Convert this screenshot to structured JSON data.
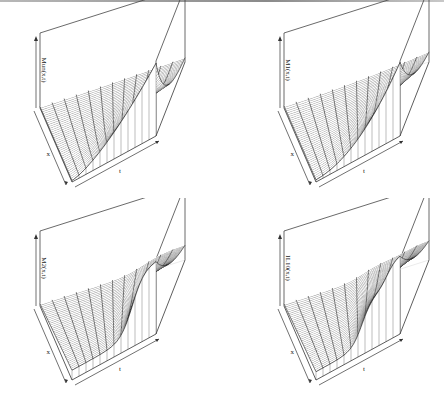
{
  "figure": {
    "layout": "2x2 grid of 3D perspective surface plots"
  },
  "chart_data": [
    {
      "type": "surface",
      "title": "",
      "xlabel": "x",
      "ylabel": "t",
      "zlabel": "Mun(x,t)",
      "shape": "increasing in t, steep rise near x = 0, decaying along x",
      "grid": {
        "x_lines": 40,
        "t_lines": 12
      },
      "description": "Monotone increase over time, concentrated at small x"
    },
    {
      "type": "surface",
      "title": "",
      "xlabel": "x",
      "ylabel": "t",
      "zlabel": "M1(x,t)",
      "shape": "increasing in t, smooth decay along x, dense near front edge",
      "grid": {
        "x_lines": 40,
        "t_lines": 12
      },
      "description": "Rising over time with a ridge near x = 0"
    },
    {
      "type": "surface",
      "title": "",
      "xlabel": "x",
      "ylabel": "t",
      "zlabel": "M2(x,t)",
      "shape": "sigmoid rise in t, then plateau; front step near x = 0",
      "grid": {
        "x_lines": 40,
        "t_lines": 12
      },
      "description": "Step-like increase at intermediate times"
    },
    {
      "type": "surface",
      "title": "",
      "xlabel": "x",
      "ylabel": "t",
      "zlabel": "IL10(x,t)",
      "shape": "sigmoid rise in t with a shoulder; plateau at large t",
      "grid": {
        "x_lines": 40,
        "t_lines": 12
      },
      "description": "Delayed sigmoidal increase over time"
    }
  ]
}
